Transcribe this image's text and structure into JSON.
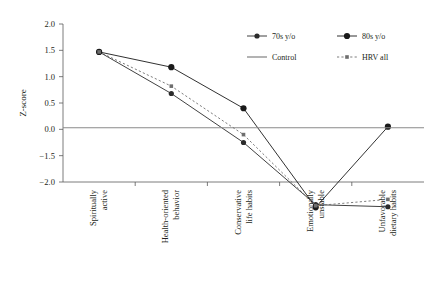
{
  "chart_data": {
    "type": "line",
    "title": "",
    "xlabel": "",
    "ylabel": "Z-score",
    "ylim": [
      -2.0,
      2.0
    ],
    "grid": false,
    "legend_position": "top-right",
    "categories": [
      "Spiritually active",
      "Health-oriented behavior",
      "Conservative life habits",
      "Emotionally unstable",
      "Unfavorable dietary habits"
    ],
    "ytick_labels": [
      "2.0",
      "1.5",
      "1.0",
      "0.5",
      "0.0",
      "-1.5",
      "-2.0"
    ],
    "ytick_values": [
      2.0,
      1.5,
      1.0,
      0.5,
      0.0,
      -0.5,
      -1.0
    ],
    "series": [
      {
        "name": "70s y/o",
        "marker": "filled-circle",
        "line": "solid",
        "color": "#2b2b2b",
        "values": [
          1.47,
          0.68,
          -0.25,
          -1.43,
          -1.47
        ]
      },
      {
        "name": "80s y/o",
        "marker": "filled-circle-large",
        "line": "solid",
        "color": "#1a1a1a",
        "values": [
          1.47,
          1.18,
          0.4,
          -1.48,
          0.05
        ]
      },
      {
        "name": "Control",
        "marker": "none",
        "line": "solid",
        "color": "#8a8a8a",
        "values": [
          0.03,
          0.03,
          0.03,
          0.03,
          0.03
        ]
      },
      {
        "name": "HRV all",
        "marker": "small-square",
        "line": "dotted",
        "color": "#6e6e6e",
        "values": [
          1.47,
          0.82,
          -0.1,
          -1.45,
          -1.33
        ]
      }
    ]
  },
  "legend": {
    "entries": [
      {
        "label": "70s y/o"
      },
      {
        "label": "80s y/o"
      },
      {
        "label": "Control"
      },
      {
        "label": "HRV all"
      }
    ]
  }
}
